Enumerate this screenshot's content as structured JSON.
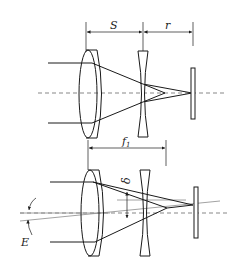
{
  "figure": {
    "top_panel": {
      "labels": {
        "S": "S",
        "r": "r"
      }
    },
    "bottom_panel": {
      "labels": {
        "f": "f",
        "f_sub": "1",
        "delta": "δ",
        "E": "E"
      }
    }
  },
  "colors": {
    "line": "#1a1a1a",
    "gray_line": "#8a8a8a",
    "background": "#ffffff"
  }
}
